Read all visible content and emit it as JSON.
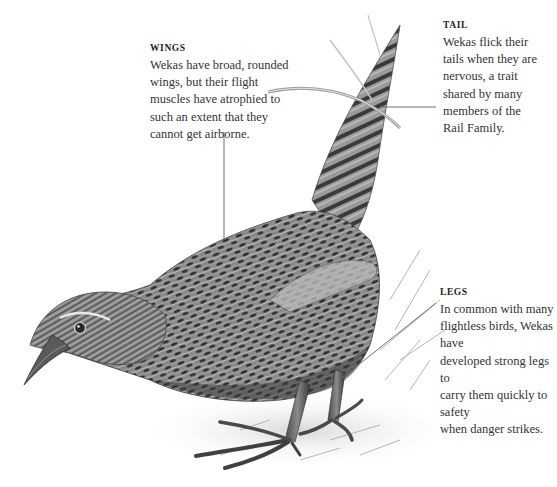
{
  "figure": {
    "background_color": "#ffffff",
    "leader_line_color": "#6e6e6e"
  },
  "callouts": {
    "wings": {
      "title": "WINGS",
      "body": "Wekas have broad, rounded\nwings, but their flight\nmuscles have atrophied to\nsuch an extent that they\ncannot get airborne."
    },
    "tail": {
      "title": "TAIL",
      "body": "Wekas flick their\ntails when they are\nnervous, a trait\nshared by many\nmembers of the\nRail Family."
    },
    "legs": {
      "title": "LEGS",
      "body": "In common with many\nflightless birds, Wekas have\ndeveloped strong legs to\ncarry them quickly to safety\nwhen danger strikes."
    }
  }
}
